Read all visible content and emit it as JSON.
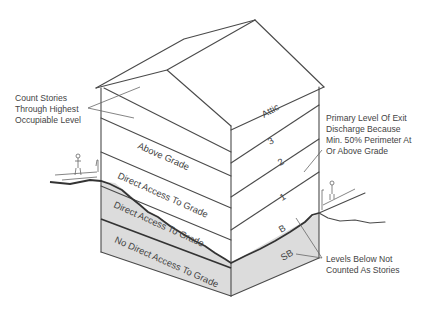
{
  "diagram": {
    "colors": {
      "line": "#4a4a4a",
      "below_grade_fill": "#dcdcdc",
      "text": "#444444"
    },
    "left_wall_levels": [
      {
        "id": "attic-gable",
        "label": ""
      },
      {
        "id": "above-grade",
        "label": "Above Grade"
      },
      {
        "id": "direct-access-1",
        "label": "Direct Access To Grade"
      },
      {
        "id": "direct-access-2",
        "label": "Direct Access To Grade"
      },
      {
        "id": "no-direct-access",
        "label": "No Direct Access To Grade"
      }
    ],
    "right_wall_levels": [
      {
        "id": "attic",
        "label": "Attic"
      },
      {
        "id": "story-3",
        "label": "3"
      },
      {
        "id": "story-2",
        "label": "2"
      },
      {
        "id": "story-1",
        "label": "1"
      },
      {
        "id": "basement",
        "label": "B"
      },
      {
        "id": "sub-basement",
        "label": "SB"
      }
    ],
    "annotations": {
      "count_stories": [
        "Count Stories",
        "Through Highest",
        "Occupiable Level"
      ],
      "primary_exit": [
        "Primary Level Of Exit",
        "Discharge Because",
        "Min. 50% Perimeter At",
        "Or Above Grade"
      ],
      "levels_below": [
        "Levels Below Not",
        "Counted As Stories"
      ]
    }
  }
}
